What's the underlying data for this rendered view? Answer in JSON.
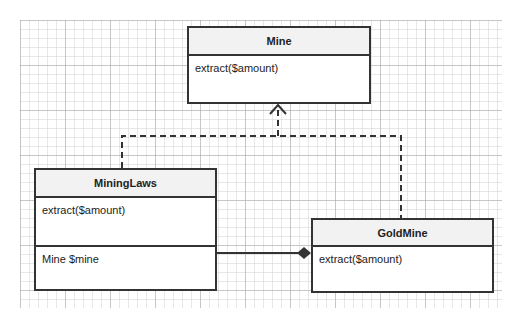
{
  "diagram": {
    "type": "UML class diagram",
    "classes": [
      {
        "name": "Mine",
        "methods": [
          "extract($amount)"
        ],
        "attributes": []
      },
      {
        "name": "MiningLaws",
        "methods": [
          "extract($amount)"
        ],
        "attributes": [
          "Mine $mine"
        ]
      },
      {
        "name": "GoldMine",
        "methods": [
          "extract($amount)"
        ],
        "attributes": []
      }
    ],
    "relations": [
      {
        "from": "MiningLaws",
        "to": "Mine",
        "kind": "realization",
        "style": "dashed-open-arrow"
      },
      {
        "from": "GoldMine",
        "to": "Mine",
        "kind": "realization",
        "style": "dashed-open-arrow"
      },
      {
        "from": "MiningLaws",
        "to": "GoldMine",
        "kind": "composition",
        "style": "solid-filled-diamond"
      }
    ],
    "colors": {
      "border": "#333333",
      "header_bg": "#f2f2f2",
      "body_bg": "#ffffff"
    }
  }
}
